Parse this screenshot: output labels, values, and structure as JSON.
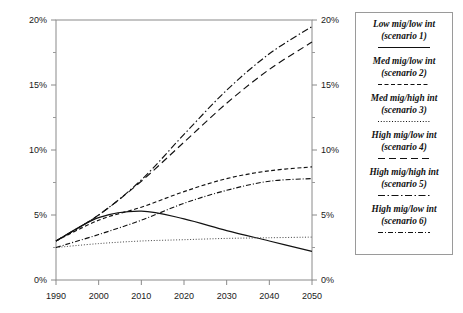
{
  "chart_data": {
    "type": "line",
    "title": "",
    "xlabel": "",
    "ylabel": "",
    "xlim": [
      1990,
      2050
    ],
    "ylim": [
      0,
      20
    ],
    "grid": false,
    "legend_position": "right-outside",
    "y_unit": "%",
    "x_ticks": [
      1990,
      2000,
      2010,
      2020,
      2030,
      2040,
      2050
    ],
    "x_tick_labels": [
      "1990",
      "2000",
      "2010",
      "2020",
      "2030",
      "2040",
      "2050"
    ],
    "y_ticks": [
      0,
      5,
      10,
      15,
      20
    ],
    "y_tick_labels": [
      "0%",
      "5%",
      "10%",
      "15%",
      "20%"
    ],
    "y_minor_ticks": [
      2.5,
      7.5,
      12.5,
      17.5
    ],
    "left_axis_labels": [
      "20%",
      "15%",
      "10%",
      "5%",
      "0%"
    ],
    "right_axis_labels": [
      "20%",
      "15%",
      "10%",
      "5%",
      "0%"
    ],
    "x": [
      1990,
      2000,
      2010,
      2020,
      2030,
      2040,
      2050
    ],
    "series": [
      {
        "name": "Low mig/low int (scenario 1)",
        "style": "solid",
        "color": "#111111",
        "values": [
          3.0,
          4.8,
          5.3,
          4.7,
          3.8,
          3.0,
          2.2
        ]
      },
      {
        "name": "Med mig/low int (scenario 2)",
        "style": "dashed",
        "color": "#111111",
        "values": [
          3.0,
          4.6,
          5.6,
          6.8,
          7.8,
          8.4,
          8.7
        ]
      },
      {
        "name": "Med mig/high int (scenario 3)",
        "style": "dotted",
        "color": "#444444",
        "values": [
          2.5,
          2.8,
          3.0,
          3.1,
          3.2,
          3.25,
          3.3
        ]
      },
      {
        "name": "High mig/low int (scenario 4)",
        "style": "long-dashed",
        "color": "#111111",
        "values": [
          3.0,
          5.0,
          7.6,
          10.6,
          13.6,
          16.2,
          18.3
        ]
      },
      {
        "name": "High mig/high int (scenario 5)",
        "style": "dash-dot",
        "color": "#111111",
        "values": [
          3.0,
          5.0,
          7.7,
          11.2,
          14.6,
          17.4,
          19.5
        ]
      },
      {
        "name": "High mig/low int (scenario 6)",
        "style": "dash-dot-fine",
        "color": "#111111",
        "values": [
          2.5,
          3.5,
          4.6,
          5.9,
          6.9,
          7.6,
          7.8
        ]
      }
    ]
  },
  "legend": {
    "entries": [
      {
        "line1": "Low mig/low int",
        "line2": "(scenario 1)",
        "style": "solid"
      },
      {
        "line1": "Med mig/low int",
        "line2": "(scenario 2)",
        "style": "dashed"
      },
      {
        "line1": "Med mig/high int",
        "line2": "(scenario 3)",
        "style": "dotted"
      },
      {
        "line1": "High mig/low int",
        "line2": "(scenario 4)",
        "style": "long-dashed"
      },
      {
        "line1": "High mig/high int",
        "line2": "(scenario 5)",
        "style": "dash-dot"
      },
      {
        "line1": "High mig/low int",
        "line2": "(scenario 6)",
        "style": "dash-dot-fine"
      }
    ]
  },
  "plot_frame": {
    "left": 56,
    "top": 20,
    "right": 312,
    "bottom": 280,
    "border_color": "#8a8a8a"
  }
}
